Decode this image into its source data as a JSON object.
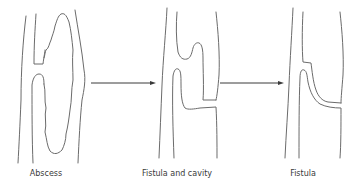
{
  "diagram": {
    "stages": [
      {
        "id": "abscess",
        "label": "Abscess",
        "label_x": 46
      },
      {
        "id": "fistula-and-cavity",
        "label": "Fistula and cavity",
        "label_x": 177
      },
      {
        "id": "fistula",
        "label": "Fistula",
        "label_x": 303
      }
    ],
    "arrows": [
      {
        "from": "abscess",
        "to": "fistula-and-cavity"
      },
      {
        "from": "fistula-and-cavity",
        "to": "fistula"
      }
    ],
    "colors": {
      "line": "#6b6b6b",
      "arrow": "#3a3a3a",
      "text": "#3a3a3a",
      "background": "#ffffff"
    }
  }
}
